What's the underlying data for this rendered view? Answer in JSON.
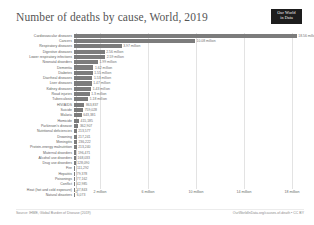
{
  "header": {
    "title": "Number of deaths by cause, World, 2019",
    "logo_line1": "Our World",
    "logo_line2": "in Data"
  },
  "footer": {
    "source": "Source: IHME, Global Burden of Disease (2019)",
    "attribution": "OurWorldInData.org/causes-of-death • CC BY"
  },
  "chart_data": {
    "type": "bar",
    "orientation": "horizontal",
    "title": "Number of deaths by cause, World, 2019",
    "xlabel": "",
    "ylabel": "",
    "xlim": [
      0,
      19500000
    ],
    "grid": true,
    "legend": false,
    "bar_color": "#7c7c7c",
    "xticks": [
      0,
      2000000,
      6000000,
      10000000,
      14000000,
      18000000
    ],
    "xtick_labels": [
      "0",
      "2 million",
      "6 million",
      "10 million",
      "14 million",
      "18 million"
    ],
    "categories": [
      "Cardiovascular diseases",
      "Cancers",
      "Respiratory diseases",
      "Digestive diseases",
      "Lower respiratory infections",
      "Neonatal disorders",
      "Dementia",
      "Diabetes",
      "Diarrheal diseases",
      "Liver diseases",
      "Kidney diseases",
      "Road injuries",
      "Tuberculosis",
      "HIV/AIDS",
      "Suicide",
      "Malaria",
      "Homicide",
      "Parkinson's disease",
      "Nutritional deficiencies",
      "Drowning",
      "Meningitis",
      "Protein-energy malnutrition",
      "Maternal disorders",
      "Alcohol use disorders",
      "Drug use disorders",
      "Fire",
      "Hepatitis",
      "Poisonings",
      "Conflict",
      "Heat (hot and cold exposure)",
      "Natural disasters"
    ],
    "values": [
      18560000,
      10080000,
      3970000,
      2550000,
      2590000,
      1990000,
      1620000,
      1550000,
      1530000,
      1470000,
      1430000,
      1300000,
      1180000,
      863837,
      759028,
      643381,
      415185,
      362907,
      213577,
      217241,
      236222,
      213240,
      196471,
      168033,
      128090,
      111292,
      79378,
      77162,
      42985,
      47843,
      6073
    ],
    "value_labels": [
      "18.56 million",
      "10.08 million",
      "3.97 million",
      "2.56 million",
      "2.59 million",
      "1.99 million",
      "1.62 million",
      "1.55 million",
      "1.53 million",
      "1.47 million",
      "1.43 million",
      "1.3 million",
      "1.18 million",
      "863,837",
      "759,028",
      "643,381",
      "415,185",
      "362,907",
      "213,577",
      "217,241",
      "236,222",
      "213,240",
      "196,471",
      "168,033",
      "128,090",
      "111,292",
      "79,378",
      "77,162",
      "42,985",
      "47,843",
      "6,073"
    ]
  }
}
